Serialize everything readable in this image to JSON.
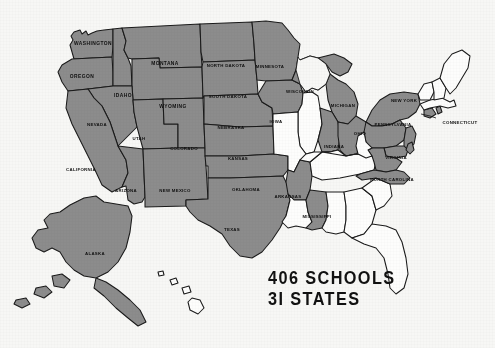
{
  "map": {
    "title": "United States highlighted-states map",
    "colors": {
      "highlight": "#8c8c8c",
      "inactive": "#fdfdfc",
      "outline": "#1a1a1a",
      "background": "#f7f7f5",
      "label_text": "#101010"
    },
    "highlighted_count": 31,
    "labeled_states": [
      {
        "code": "WA",
        "label": "WASHINGTON",
        "highlighted": true
      },
      {
        "code": "OR",
        "label": "OREGON",
        "highlighted": true
      },
      {
        "code": "ID",
        "label": "IDAHO",
        "highlighted": true
      },
      {
        "code": "MT",
        "label": "MONTANA",
        "highlighted": true
      },
      {
        "code": "WY",
        "label": "WYOMING",
        "highlighted": true
      },
      {
        "code": "ND",
        "label": "NORTH DAKOTA",
        "highlighted": true
      },
      {
        "code": "SD",
        "label": "SOUTH DAKOTA",
        "highlighted": true
      },
      {
        "code": "MN",
        "label": "MINNESOTA",
        "highlighted": true
      },
      {
        "code": "WI",
        "label": "WISCONSIN",
        "highlighted": true
      },
      {
        "code": "MI",
        "label": "MICHIGAN",
        "highlighted": true
      },
      {
        "code": "NY",
        "label": "NEW YORK",
        "highlighted": true
      },
      {
        "code": "PA",
        "label": "PENNSYLVANIA",
        "highlighted": true
      },
      {
        "code": "CT",
        "label": "CONNECTICUT",
        "highlighted": true
      },
      {
        "code": "OH",
        "label": "OHIO",
        "highlighted": true
      },
      {
        "code": "IN",
        "label": "INDIANA",
        "highlighted": true
      },
      {
        "code": "IA",
        "label": "IOWA",
        "highlighted": true
      },
      {
        "code": "NE",
        "label": "NEBRASKA",
        "highlighted": true
      },
      {
        "code": "NV",
        "label": "NEVADA",
        "highlighted": true
      },
      {
        "code": "UT",
        "label": "UTAH",
        "highlighted": true
      },
      {
        "code": "CO",
        "label": "COLORADO",
        "highlighted": true
      },
      {
        "code": "KS",
        "label": "KANSAS",
        "highlighted": true
      },
      {
        "code": "CA",
        "label": "CALIFORNIA",
        "highlighted": true
      },
      {
        "code": "AZ",
        "label": "ARIZONA",
        "highlighted": true
      },
      {
        "code": "NM",
        "label": "NEW MEXICO",
        "highlighted": true
      },
      {
        "code": "OK",
        "label": "OKLAHOMA",
        "highlighted": true
      },
      {
        "code": "AR",
        "label": "ARKANSAS",
        "highlighted": true
      },
      {
        "code": "TX",
        "label": "TEXAS",
        "highlighted": true
      },
      {
        "code": "MS",
        "label": "MISSISSIPPI",
        "highlighted": true
      },
      {
        "code": "VA",
        "label": "VIRGINIA",
        "highlighted": true
      },
      {
        "code": "NC",
        "label": "NORTH CAROLINA",
        "highlighted": true
      },
      {
        "code": "AK",
        "label": "ALASKA",
        "highlighted": true
      }
    ],
    "unlabeled_highlighted": [
      "NJ",
      "DE",
      "MD",
      "RI"
    ],
    "unlabeled_inactive": [
      "IL",
      "MO",
      "LA",
      "AL",
      "GA",
      "FL",
      "SC",
      "TN",
      "KY",
      "WV",
      "ME",
      "NH",
      "VT",
      "MA",
      "HI"
    ]
  },
  "caption": {
    "line1": "406 SCHOOLS",
    "line2": "3I STATES",
    "schools_count": "406",
    "states_count": "31"
  }
}
